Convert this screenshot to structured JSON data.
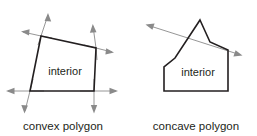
{
  "figure": {
    "name": "convex-vs-concave-polygon-diagram",
    "background_color": "#ffffff",
    "edge_color": "#231f20",
    "ray_color": "#8a8a8a",
    "text_color": "#231f20"
  },
  "panels": [
    {
      "id": "convex",
      "caption": "convex polygon",
      "interior_label": "interior",
      "caption_x": 63,
      "caption_y": 126,
      "interior_x": 65,
      "interior_y": 71,
      "polygon_points": "41,36 96,48 94,91 30,91",
      "rays": [
        {
          "name": "ray-top-left-up",
          "x1": 41,
          "y1": 36,
          "x2": 48,
          "y2": 15
        },
        {
          "name": "ray-top-left-left",
          "x1": 41,
          "y1": 36,
          "x2": 23,
          "y2": 32
        },
        {
          "name": "ray-top-right-up",
          "x1": 96,
          "y1": 48,
          "x2": 93,
          "y2": 26
        },
        {
          "name": "ray-top-right-down-right",
          "x1": 96,
          "y1": 48,
          "x2": 112,
          "y2": 52
        },
        {
          "name": "ray-bottom-left-left",
          "x1": 30,
          "y1": 91,
          "x2": 8,
          "y2": 91
        },
        {
          "name": "ray-bottom-left-down",
          "x1": 30,
          "y1": 91,
          "x2": 25,
          "y2": 111
        },
        {
          "name": "ray-bottom-right-right",
          "x1": 94,
          "y1": 91,
          "x2": 116,
          "y2": 91
        },
        {
          "name": "ray-bottom-right-down",
          "x1": 94,
          "y1": 91,
          "x2": 94,
          "y2": 111
        }
      ],
      "ray_tails": [
        {
          "name": "tail-top-left-vertical",
          "x1": 41,
          "y1": 36,
          "x2": 38,
          "y2": 45
        },
        {
          "name": "tail-top-left-horizontal",
          "x1": 41,
          "y1": 36,
          "x2": 52,
          "y2": 38
        },
        {
          "name": "tail-top-right-vertical",
          "x1": 96,
          "y1": 48,
          "x2": 97,
          "y2": 60
        },
        {
          "name": "tail-top-right-horizontal",
          "x1": 96,
          "y1": 48,
          "x2": 84,
          "y2": 45
        },
        {
          "name": "tail-bottom-left-horizontal",
          "x1": 30,
          "y1": 91,
          "x2": 44,
          "y2": 91
        },
        {
          "name": "tail-bottom-left-vertical",
          "x1": 30,
          "y1": 91,
          "x2": 33,
          "y2": 79
        },
        {
          "name": "tail-bottom-right-horizontal",
          "x1": 94,
          "y1": 91,
          "x2": 80,
          "y2": 91
        },
        {
          "name": "tail-bottom-right-vertical",
          "x1": 94,
          "y1": 91,
          "x2": 94,
          "y2": 79
        }
      ]
    },
    {
      "id": "concave",
      "caption": "concave polygon",
      "interior_label": "interior",
      "caption_x": 196,
      "caption_y": 126,
      "interior_x": 198,
      "interior_y": 72,
      "polygon_points": "200,20 210,42 228,50 228,91 164,91 164,67 175,58",
      "secant": {
        "name": "secant-line",
        "x1": 147,
        "y1": 25,
        "x2": 241,
        "y2": 55
      },
      "secant_heads": [
        {
          "name": "secant-head-left",
          "x": 147,
          "y": 25,
          "angle": 197.7
        },
        {
          "name": "secant-head-right",
          "x": 241,
          "y": 55,
          "angle": 17.7
        }
      ]
    }
  ]
}
